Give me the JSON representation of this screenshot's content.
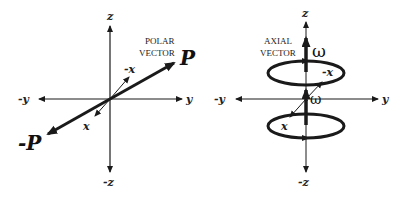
{
  "figure": {
    "left_panel": {
      "caption_line1": "POLAR",
      "caption_line2": "VECTOR",
      "vector_label": "P",
      "negative_vector_label": "-P",
      "axes": {
        "z": "z",
        "neg_z": "-z",
        "y": "y",
        "neg_y": "-y",
        "x": "x",
        "neg_x": "-x"
      }
    },
    "right_panel": {
      "caption_line1": "AXIAL",
      "caption_line2": "VECTOR",
      "vector_label": "ω",
      "reflected_vector_label": "ω",
      "axes": {
        "z": "z",
        "neg_z": "-z",
        "y": "y",
        "neg_y": "-y",
        "x": "x",
        "neg_x": "-x"
      }
    },
    "colors": {
      "stroke": "#1a1a1a",
      "background": "#ffffff"
    }
  }
}
